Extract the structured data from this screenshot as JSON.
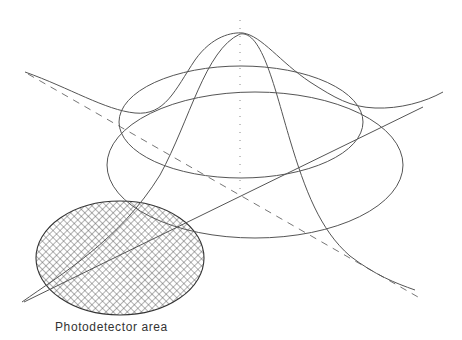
{
  "diagram": {
    "labels": {
      "photodetector": "Photodetector area"
    },
    "colors": {
      "line": "#555555",
      "dashed": "#777777",
      "hatch": "#444444",
      "background": "#ffffff"
    }
  }
}
